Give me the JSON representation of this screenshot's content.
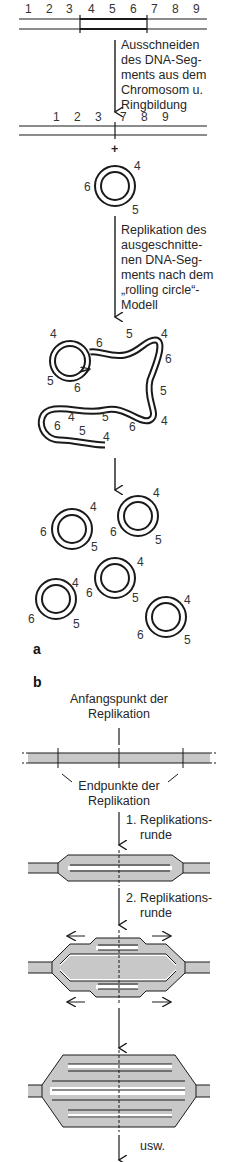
{
  "panel_a": {
    "label": "a",
    "chromosome_numbers_top": [
      "1",
      "2",
      "3",
      "4",
      "5",
      "6",
      "7",
      "8",
      "9"
    ],
    "chromosome_numbers_after_excision": [
      "1",
      "2",
      "3",
      "7",
      "8",
      "9"
    ],
    "step1_caption": [
      "Ausschneiden",
      "des DNA-Seg-",
      "ments aus dem",
      "Chromosom u.",
      "Ringbildung"
    ],
    "plus_sign": "+",
    "ring_labels": [
      "4",
      "6",
      "5"
    ],
    "step2_caption": [
      "Replikation des",
      "ausgeschnitte-",
      "nen DNA-Seg-",
      "ments nach dem",
      "„rolling circle“-",
      "Modell"
    ],
    "rolling_circle_labels": [
      "4",
      "6",
      "5",
      "4",
      "6",
      "5",
      "4",
      "5",
      "6",
      "6",
      "4",
      "5",
      "6",
      "5",
      "4"
    ],
    "product_rings_count": 5
  },
  "panel_b": {
    "label": "b",
    "origin_label": [
      "Anfangspunkt der",
      "Replikation"
    ],
    "endpoints_label": [
      "Endpunkte der",
      "Replikation"
    ],
    "round1_label": [
      "1. Replikations-",
      "runde"
    ],
    "round2_label": [
      "2. Replikations-",
      "runde"
    ],
    "continuation_label": "usw."
  },
  "colors": {
    "ink": "#1a1a1a",
    "shading": "#c8c8c8",
    "background": "#ffffff"
  }
}
